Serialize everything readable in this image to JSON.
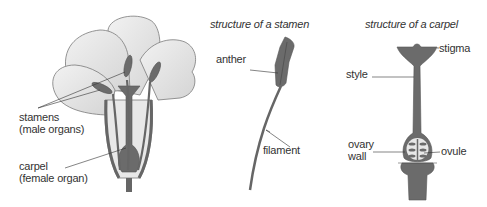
{
  "diagram": {
    "flower": {
      "labels": {
        "stamens": "stamens",
        "stamens_note": "(male organs)",
        "carpel": "carpel",
        "carpel_note": "(female organ)"
      }
    },
    "stamen": {
      "title": "structure of a stamen",
      "labels": {
        "anther": "anther",
        "filament": "filament"
      }
    },
    "carpel": {
      "title": "structure of a carpel",
      "labels": {
        "stigma": "stigma",
        "style": "style",
        "ovary_wall_1": "ovary",
        "ovary_wall_2": "wall",
        "ovule": "ovule"
      }
    },
    "colors": {
      "petal": "#e4e4e4",
      "petal_edge": "#7a7a7a",
      "organ": "#6b6b6b",
      "organ_dark": "#555555",
      "text": "#333333"
    }
  }
}
